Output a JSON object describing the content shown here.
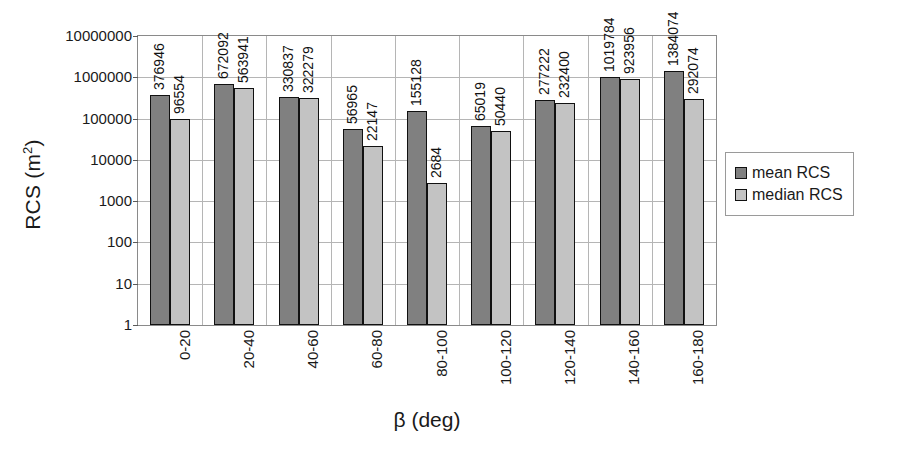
{
  "chart_data": {
    "type": "bar",
    "title": "",
    "xlabel": "β (deg)",
    "ylabel": "RCS (m2)",
    "ylabel_base": "RCS (m",
    "ylabel_sup": "2",
    "ylabel_tail": ")",
    "yscale": "log",
    "ylim": [
      1,
      10000000
    ],
    "grid": true,
    "legend_position": "right",
    "categories": [
      "0-20",
      "20-40",
      "40-60",
      "60-80",
      "80-100",
      "100-120",
      "120-140",
      "140-160",
      "160-180"
    ],
    "y_ticks": [
      "10000000",
      "1000000",
      "100000",
      "10000",
      "1000",
      "100",
      "10",
      "1"
    ],
    "y_tick_values": [
      10000000,
      1000000,
      100000,
      10000,
      1000,
      100,
      10,
      1
    ],
    "series": [
      {
        "name": "mean RCS",
        "color": "#808080",
        "values": [
          376946,
          672092,
          330837,
          56965,
          155128,
          65019,
          277222,
          1019784,
          1384074
        ],
        "labels": [
          "376946",
          "672092",
          "330837",
          "56965",
          "155128",
          "65019",
          "277222",
          "1019784",
          "1384074"
        ]
      },
      {
        "name": "median RCS",
        "color": "#c3c3c3",
        "values": [
          96554,
          563941,
          322279,
          22147,
          2684,
          50440,
          232400,
          923956,
          292074
        ],
        "labels": [
          "96554",
          "563941",
          "322279",
          "22147",
          "2684",
          "50440",
          "232400",
          "923956",
          "292074"
        ]
      }
    ]
  },
  "legend": {
    "items": [
      {
        "label": "mean RCS",
        "color": "#808080"
      },
      {
        "label": "median RCS",
        "color": "#c3c3c3"
      }
    ]
  }
}
